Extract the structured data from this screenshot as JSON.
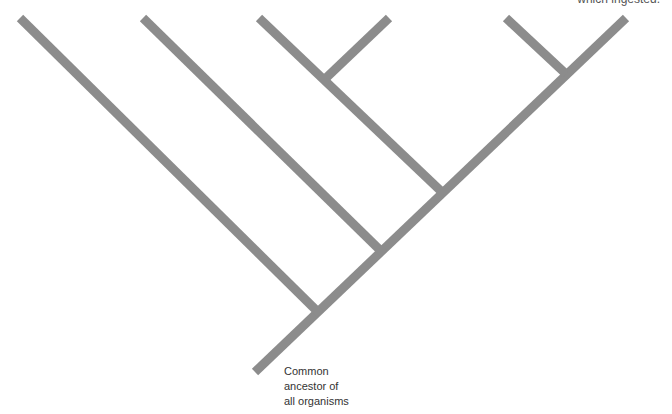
{
  "diagram": {
    "type": "phylogenetic-tree",
    "branch_color": "#8c8c8c",
    "top_label": "which ingested.",
    "root_label": {
      "lines": [
        "Common",
        "ancestor of",
        "all organisms"
      ]
    }
  }
}
